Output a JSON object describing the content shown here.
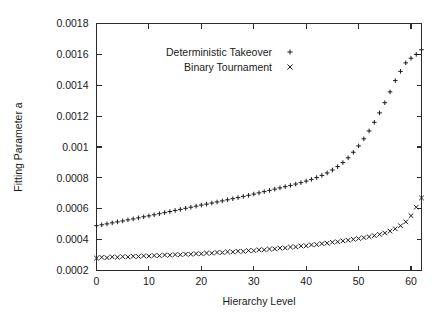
{
  "chart_data": {
    "type": "scatter",
    "title": "",
    "xlabel": "Hierarchy Level",
    "ylabel": "Fitting Parameter a",
    "xlim": [
      0,
      62
    ],
    "ylim": [
      0.0002,
      0.0018
    ],
    "grid": false,
    "legend_position": "top-center",
    "xticks": [
      0,
      10,
      20,
      30,
      40,
      50,
      60
    ],
    "xticklabels": [
      "0",
      "10",
      "20",
      "30",
      "40",
      "50",
      "60"
    ],
    "yticks": [
      0.0002,
      0.0004,
      0.0006,
      0.0008,
      0.001,
      0.0012,
      0.0014,
      0.0016,
      0.0018
    ],
    "yticklabels": [
      "0.0002",
      "0.0004",
      "0.0006",
      "0.0008",
      "0.001",
      "0.0012",
      "0.0014",
      "0.0016",
      "0.0018"
    ],
    "series": [
      {
        "name": "Deterministic Takeover",
        "marker": "plus",
        "color": "#1a1a1a",
        "x": [
          0,
          1,
          2,
          3,
          4,
          5,
          6,
          7,
          8,
          9,
          10,
          11,
          12,
          13,
          14,
          15,
          16,
          17,
          18,
          19,
          20,
          21,
          22,
          23,
          24,
          25,
          26,
          27,
          28,
          29,
          30,
          31,
          32,
          33,
          34,
          35,
          36,
          37,
          38,
          39,
          40,
          41,
          42,
          43,
          44,
          45,
          46,
          47,
          48,
          49,
          50,
          51,
          52,
          53,
          54,
          55,
          56,
          57,
          58,
          59,
          60,
          61,
          62
        ],
        "y": [
          0.00049,
          0.000496,
          0.000502,
          0.000509,
          0.000515,
          0.000521,
          0.000528,
          0.000534,
          0.000541,
          0.000548,
          0.000554,
          0.000561,
          0.000568,
          0.000575,
          0.000582,
          0.000589,
          0.000596,
          0.000603,
          0.00061,
          0.000617,
          0.000624,
          0.00063,
          0.000637,
          0.000644,
          0.000651,
          0.000658,
          0.000665,
          0.000672,
          0.00068,
          0.000687,
          0.000695,
          0.000703,
          0.000711,
          0.000719,
          0.000727,
          0.000735,
          0.000743,
          0.000751,
          0.00076,
          0.000769,
          0.000779,
          0.00079,
          0.000802,
          0.000816,
          0.000832,
          0.000851,
          0.000873,
          0.000899,
          0.00093,
          0.000966,
          0.001007,
          0.001053,
          0.001104,
          0.00116,
          0.001221,
          0.001287,
          0.001357,
          0.00143,
          0.00149,
          0.001545,
          0.001575,
          0.0016,
          0.00163
        ]
      },
      {
        "name": "Binary Tournament",
        "marker": "cross",
        "color": "#1a1a1a",
        "x": [
          0,
          1,
          2,
          3,
          4,
          5,
          6,
          7,
          8,
          9,
          10,
          11,
          12,
          13,
          14,
          15,
          16,
          17,
          18,
          19,
          20,
          21,
          22,
          23,
          24,
          25,
          26,
          27,
          28,
          29,
          30,
          31,
          32,
          33,
          34,
          35,
          36,
          37,
          38,
          39,
          40,
          41,
          42,
          43,
          44,
          45,
          46,
          47,
          48,
          49,
          50,
          51,
          52,
          53,
          54,
          55,
          56,
          57,
          58,
          59,
          60,
          61,
          62
        ],
        "y": [
          0.00028,
          0.000285,
          0.000283,
          0.000288,
          0.000286,
          0.00029,
          0.000288,
          0.000292,
          0.000291,
          0.000295,
          0.000293,
          0.000297,
          0.000296,
          0.0003,
          0.000299,
          0.000303,
          0.000302,
          0.000306,
          0.000305,
          0.000309,
          0.000308,
          0.000313,
          0.000312,
          0.000317,
          0.000316,
          0.000321,
          0.00032,
          0.000325,
          0.000324,
          0.000329,
          0.000329,
          0.000334,
          0.000334,
          0.000339,
          0.00034,
          0.000345,
          0.000346,
          0.000352,
          0.000353,
          0.000359,
          0.00036,
          0.000366,
          0.000368,
          0.000374,
          0.000377,
          0.000383,
          0.000386,
          0.000392,
          0.000396,
          0.000402,
          0.000407,
          0.000413,
          0.000419,
          0.000426,
          0.000434,
          0.000443,
          0.000455,
          0.00047,
          0.00049,
          0.000515,
          0.000555,
          0.00061,
          0.00067
        ]
      }
    ]
  },
  "legend": {
    "entries": [
      {
        "label": "Deterministic Takeover",
        "marker": "+"
      },
      {
        "label": "Binary Tournament",
        "marker": "×"
      }
    ]
  }
}
